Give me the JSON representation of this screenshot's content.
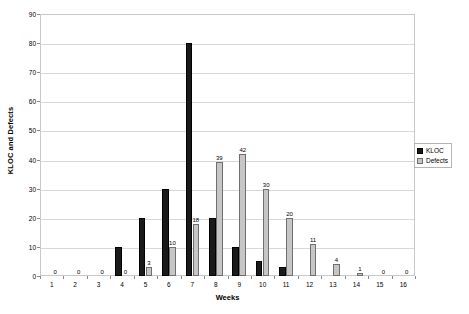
{
  "chart_data": {
    "type": "bar",
    "title": "",
    "xlabel": "Weeks",
    "ylabel": "KLOC and Defects",
    "categories": [
      "1",
      "2",
      "3",
      "4",
      "5",
      "6",
      "7",
      "8",
      "9",
      "10",
      "11",
      "12",
      "13",
      "14",
      "15",
      "16"
    ],
    "series": [
      {
        "name": "KLOC",
        "color": "#1a1a1a",
        "values": [
          0,
          0,
          0,
          10,
          20,
          30,
          80,
          20,
          10,
          5,
          3,
          0,
          0,
          0,
          0,
          0
        ]
      },
      {
        "name": "Defects",
        "color": "#c6c6c6",
        "values": [
          0,
          0,
          0,
          0,
          3,
          10,
          18,
          39,
          42,
          30,
          20,
          11,
          4,
          1,
          0,
          0
        ]
      }
    ],
    "data_labels": [
      "0",
      "0",
      "0",
      "0",
      "3",
      "10",
      "18",
      "39",
      "42",
      "30",
      "20",
      "11",
      "4",
      "1",
      "0",
      "0"
    ],
    "ylim": [
      0,
      90
    ],
    "yticks": [
      "0",
      "10",
      "20",
      "30",
      "40",
      "50",
      "60",
      "70",
      "80",
      "90"
    ],
    "grid": true,
    "legend_position": "right"
  },
  "legend": {
    "entries": [
      {
        "label": "KLOC"
      },
      {
        "label": "Defects"
      }
    ]
  }
}
